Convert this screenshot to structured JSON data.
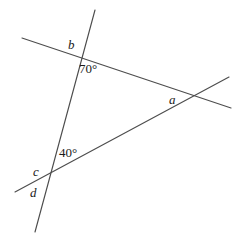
{
  "figure": {
    "type": "geometry-diagram",
    "width": 244,
    "height": 237,
    "background_color": "#ffffff",
    "line_color": "#4d4d4d",
    "text_color": "#1a1a1a"
  },
  "lines": [
    {
      "name": "steep-line",
      "description": "Steep line running from upper right down to lower left, passing through vertex b and vertex c",
      "x1": 95,
      "y1": 10,
      "x2": 35,
      "y2": 232
    },
    {
      "name": "upper-transversal",
      "description": "Gently descending line from upper left through vertex b to vertex a and beyond to the right",
      "x1": 22,
      "y1": 38,
      "x2": 231,
      "y2": 108
    },
    {
      "name": "lower-rising-line",
      "description": "Rising line from lower left through vertex c up through vertex a to the upper right",
      "x1": 15,
      "y1": 192,
      "x2": 229,
      "y2": 77
    }
  ],
  "vertices": [
    {
      "name": "vertex-b",
      "x": 80,
      "y": 58
    },
    {
      "name": "vertex-a",
      "x": 197,
      "y": 97
    },
    {
      "name": "vertex-c",
      "x": 47,
      "y": 175
    }
  ],
  "labels": [
    {
      "name": "label-b",
      "text": "b",
      "style": "italic",
      "x": 68,
      "y": 38
    },
    {
      "name": "label-angle-70",
      "text": "70°",
      "style": "normal",
      "x": 79,
      "y": 62
    },
    {
      "name": "label-a",
      "text": "a",
      "style": "italic",
      "x": 169,
      "y": 93
    },
    {
      "name": "label-angle-40",
      "text": "40°",
      "style": "normal",
      "x": 59,
      "y": 146
    },
    {
      "name": "label-c",
      "text": "c",
      "style": "italic",
      "x": 33,
      "y": 165
    },
    {
      "name": "label-d",
      "text": "d",
      "style": "italic",
      "x": 30,
      "y": 186
    }
  ]
}
